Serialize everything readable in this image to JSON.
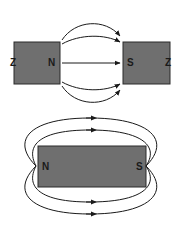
{
  "diagrams": [
    {
      "title": "Two magnets, opposite poles facing",
      "left_magnet": {
        "left_label": "Z",
        "right_label": "N"
      },
      "right_magnet": {
        "left_label": "S",
        "right_label": "Z"
      },
      "field_lines": 5,
      "direction": "N to S"
    },
    {
      "title": "Single bar magnet",
      "magnet": {
        "left_label": "N",
        "right_label": "S"
      },
      "field_lines_top": 2,
      "field_lines_bottom": 2,
      "arrow_direction": "right"
    }
  ],
  "colors": {
    "magnet_fill": "#6f6f6f",
    "magnet_stroke": "#2a2a2a",
    "line": "#1a1a1a"
  }
}
